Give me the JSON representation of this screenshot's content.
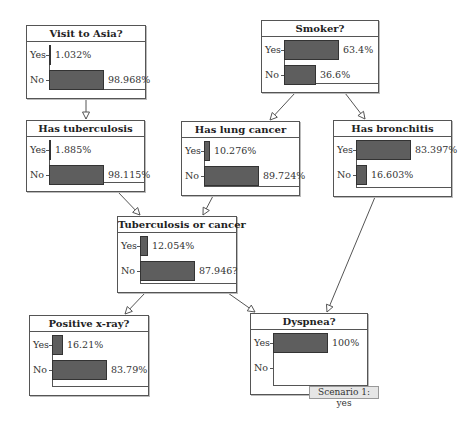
{
  "diagram": {
    "type": "bayesian-network",
    "bar_color": "#5e5e5e",
    "nodes": [
      {
        "id": "asia",
        "title": "Visit to Asia?",
        "box": [
          26,
          25,
          120,
          74
        ],
        "states": [
          {
            "label": "Yes",
            "value": 1.032,
            "text": "1.032%"
          },
          {
            "label": "No",
            "value": 98.968,
            "text": "98.968%"
          }
        ]
      },
      {
        "id": "smoker",
        "title": "Smoker?",
        "box": [
          261,
          20,
          118,
          73
        ],
        "states": [
          {
            "label": "Yes",
            "value": 63.4,
            "text": "63.4%"
          },
          {
            "label": "No",
            "value": 36.6,
            "text": "36.6%"
          }
        ]
      },
      {
        "id": "tub",
        "title": "Has tuberculosis",
        "box": [
          26,
          120,
          119,
          72
        ],
        "states": [
          {
            "label": "Yes",
            "value": 1.885,
            "text": "1.885%"
          },
          {
            "label": "No",
            "value": 98.115,
            "text": "98.115%"
          }
        ]
      },
      {
        "id": "lung",
        "title": "Has lung cancer",
        "box": [
          181,
          121,
          119,
          75
        ],
        "states": [
          {
            "label": "Yes",
            "value": 10.276,
            "text": "10.276%"
          },
          {
            "label": "No",
            "value": 89.724,
            "text": "89.724%"
          }
        ]
      },
      {
        "id": "bronc",
        "title": "Has bronchitis",
        "box": [
          333,
          120,
          119,
          77
        ],
        "states": [
          {
            "label": "Yes",
            "value": 83.397,
            "text": "83.397%"
          },
          {
            "label": "No",
            "value": 16.603,
            "text": "16.603%"
          }
        ]
      },
      {
        "id": "either",
        "title": "Tuberculosis or cancer",
        "box": [
          117,
          216,
          120,
          77
        ],
        "states": [
          {
            "label": "Yes",
            "value": 12.054,
            "text": "12.054%"
          },
          {
            "label": "No",
            "value": 87.946,
            "text": "87.946?"
          }
        ]
      },
      {
        "id": "xray",
        "title": "Positive x-ray?",
        "box": [
          29,
          315,
          120,
          81
        ],
        "states": [
          {
            "label": "Yes",
            "value": 16.21,
            "text": "16.21%"
          },
          {
            "label": "No",
            "value": 83.79,
            "text": "83.79%"
          }
        ]
      },
      {
        "id": "dysp",
        "title": "Dyspnea?",
        "box": [
          250,
          313,
          118,
          82
        ],
        "states": [
          {
            "label": "Yes",
            "value": 100,
            "text": "100%"
          },
          {
            "label": "No",
            "value": 0,
            "text": ""
          }
        ]
      }
    ],
    "edges": [
      {
        "from": "asia",
        "to": "tub",
        "points": [
          86,
          99,
          86,
          119
        ]
      },
      {
        "from": "smoker",
        "to": "lung",
        "points": [
          295,
          93,
          270,
          120
        ]
      },
      {
        "from": "smoker",
        "to": "bronc",
        "points": [
          345,
          93,
          365,
          119
        ]
      },
      {
        "from": "tub",
        "to": "either",
        "points": [
          118,
          192,
          140,
          215
        ]
      },
      {
        "from": "lung",
        "to": "either",
        "points": [
          213,
          196,
          203,
          215
        ]
      },
      {
        "from": "either",
        "to": "xray",
        "points": [
          145,
          293,
          125,
          314
        ]
      },
      {
        "from": "either",
        "to": "dysp",
        "points": [
          228,
          293,
          255,
          312
        ]
      },
      {
        "from": "bronc",
        "to": "dysp",
        "points": [
          375,
          197,
          327,
          312
        ]
      }
    ],
    "scenario_label": "Scenario 1: yes"
  },
  "chart_data": {
    "type": "bar",
    "orientation": "horizontal",
    "categories": [
      "Yes",
      "No"
    ],
    "series": [
      {
        "name": "Visit to Asia?",
        "values": [
          1.032,
          98.968
        ]
      },
      {
        "name": "Smoker?",
        "values": [
          63.4,
          36.6
        ]
      },
      {
        "name": "Has tuberculosis",
        "values": [
          1.885,
          98.115
        ]
      },
      {
        "name": "Has lung cancer",
        "values": [
          10.276,
          89.724
        ]
      },
      {
        "name": "Has bronchitis",
        "values": [
          83.397,
          16.603
        ]
      },
      {
        "name": "Tuberculosis or cancer",
        "values": [
          12.054,
          87.946
        ]
      },
      {
        "name": "Positive x-ray?",
        "values": [
          16.21,
          83.79
        ]
      },
      {
        "name": "Dyspnea?",
        "values": [
          100,
          0
        ]
      }
    ],
    "annotations": [
      "Scenario 1: yes"
    ],
    "xlabel": "",
    "ylabel": "",
    "unit": "%"
  }
}
